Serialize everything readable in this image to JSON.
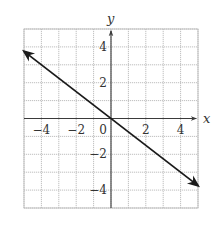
{
  "chart_data": {
    "type": "line",
    "title": "",
    "xlabel": "x",
    "ylabel": "y",
    "xlim": [
      -5,
      5
    ],
    "ylim": [
      -5,
      5
    ],
    "grid": true,
    "grid_step": 1,
    "x_ticks": [
      {
        "value": -4,
        "label": "−4"
      },
      {
        "value": -2,
        "label": "−2"
      },
      {
        "value": 0,
        "label": "0"
      },
      {
        "value": 2,
        "label": "2"
      },
      {
        "value": 4,
        "label": "4"
      }
    ],
    "y_ticks": [
      {
        "value": 4,
        "label": "4"
      },
      {
        "value": 2,
        "label": "2"
      },
      {
        "value": -2,
        "label": "−2"
      },
      {
        "value": -4,
        "label": "−4"
      }
    ],
    "series": [
      {
        "name": "y = -3/4 x",
        "equation": "y = -0.75x",
        "slope": -0.75,
        "intercept": 0,
        "x": [
          -5,
          5
        ],
        "y": [
          3.75,
          -3.75
        ],
        "arrows_both_ends": true,
        "color": "#1a1a1a"
      }
    ],
    "axis_arrows": true
  }
}
